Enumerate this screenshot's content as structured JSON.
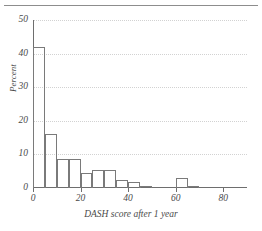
{
  "figure": {
    "has_top_rule": true,
    "background_color": "#ffffff",
    "line_color": "#7a7a7a",
    "grid_color": "#d2d2d2",
    "text_color": "#4a4a4a"
  },
  "chart_data": {
    "type": "bar",
    "title": "",
    "subtitle": "",
    "xlabel": "DASH score after 1 year",
    "ylabel": "Percent",
    "xlim": [
      0,
      90
    ],
    "ylim": [
      0,
      50
    ],
    "grid": "horizontal-dotted",
    "legend": "none",
    "bin_width": 5,
    "xticks": [
      0,
      20,
      40,
      60,
      80
    ],
    "xtick_labels": [
      "0",
      "20",
      "40",
      "60",
      "80"
    ],
    "yticks": [
      0,
      10,
      20,
      30,
      40,
      50
    ],
    "ytick_labels": [
      "0",
      "10",
      "20",
      "30",
      "40",
      "50"
    ],
    "categories": [
      "0-5",
      "5-10",
      "10-15",
      "15-20",
      "20-25",
      "25-30",
      "30-35",
      "35-40",
      "40-45",
      "45-50",
      "50-55",
      "55-60",
      "60-65",
      "65-70"
    ],
    "bin_starts": [
      0,
      5,
      10,
      15,
      20,
      25,
      30,
      35,
      40,
      45,
      50,
      55,
      60,
      65
    ],
    "values": [
      42.0,
      16.2,
      8.7,
      8.7,
      4.5,
      5.5,
      5.5,
      2.3,
      1.8,
      0.7,
      0,
      0,
      2.9,
      0.7
    ],
    "series": [
      {
        "name": "Percent",
        "values": [
          42.0,
          16.2,
          8.7,
          8.7,
          4.5,
          5.5,
          5.5,
          2.3,
          1.8,
          0.7,
          0,
          0,
          2.9,
          0.7
        ]
      }
    ]
  }
}
